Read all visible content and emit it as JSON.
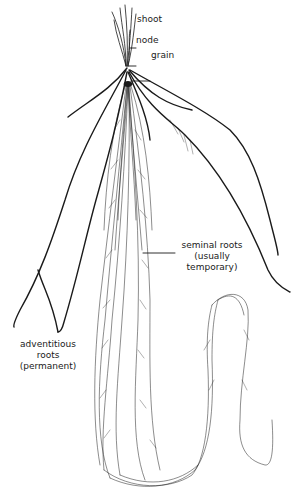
{
  "diagram": {
    "labels": {
      "shoot": "shoot",
      "node": "node",
      "grain": "grain",
      "seminal_line1": "seminal roots",
      "seminal_line2": "(usually",
      "seminal_line3": "temporary)",
      "adventitious_line1": "adventitious",
      "adventitious_line2": "roots",
      "adventitious_line3": "(permanent)"
    },
    "colors": {
      "ink": "#1a1a1a",
      "background": "#ffffff"
    }
  }
}
